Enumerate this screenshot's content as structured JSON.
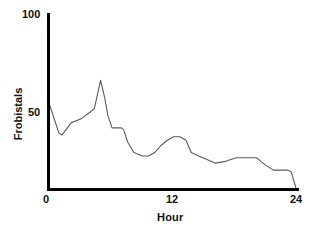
{
  "chart_data": {
    "type": "line",
    "title": "",
    "subtitle": "",
    "xlabel": "Hour",
    "ylabel": "Frobistals",
    "xlim": [
      0,
      24
    ],
    "ylim": [
      0,
      100
    ],
    "xticks": [
      0,
      12,
      24
    ],
    "xticklabels": [
      "0",
      "12",
      "24"
    ],
    "yticks": [
      50,
      100
    ],
    "yticklabels": [
      "50",
      "100"
    ],
    "grid": false,
    "legend": false,
    "legend_position": "none",
    "line_color": "#5a5a5a",
    "axis_color": "#000000",
    "background_color": "#ffffff",
    "series": [
      {
        "name": "Frobistals",
        "x": [
          0.0,
          1.0,
          1.3,
          2.2,
          3.1,
          4.0,
          4.4,
          5.0,
          5.4,
          5.7,
          6.1,
          7.0,
          7.2,
          7.6,
          8.2,
          9.0,
          9.6,
          10.2,
          10.8,
          11.4,
          12.0,
          12.6,
          13.2,
          13.7,
          14.4,
          15.2,
          16.0,
          17.0,
          18.0,
          19.0,
          20.0,
          20.8,
          21.6,
          23.0,
          23.3,
          23.8
        ],
        "values": [
          50.0,
          32.0,
          31.0,
          38.0,
          40.0,
          44.0,
          46.0,
          62.0,
          52.0,
          42.0,
          35.0,
          35.0,
          34.0,
          27.0,
          21.0,
          19.0,
          19.0,
          21.0,
          25.0,
          28.0,
          30.0,
          30.0,
          28.0,
          21.0,
          19.0,
          17.0,
          15.0,
          16.0,
          18.0,
          18.0,
          18.0,
          14.0,
          11.0,
          11.0,
          10.0,
          0.0
        ]
      }
    ],
    "annotations": []
  },
  "axis": {
    "y_tick_top_label": "100",
    "y_tick_mid_label": "50",
    "x_tick_start_label": "0",
    "x_tick_mid_label": "12",
    "x_tick_end_label": "24",
    "y_axis_title": "Frobistals",
    "x_axis_title": "Hour"
  }
}
